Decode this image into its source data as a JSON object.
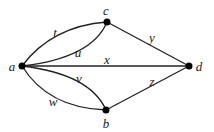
{
  "graph": {
    "nodes": [
      {
        "id": "a",
        "label": "a",
        "x": 22,
        "y": 66
      },
      {
        "id": "b",
        "label": "b",
        "x": 106,
        "y": 110
      },
      {
        "id": "c",
        "label": "c",
        "x": 107,
        "y": 22
      },
      {
        "id": "d",
        "label": "d",
        "x": 189,
        "y": 66
      }
    ],
    "edges": [
      {
        "id": "t",
        "label": "t",
        "from": "a",
        "to": "c"
      },
      {
        "id": "u",
        "label": "u",
        "from": "a",
        "to": "c"
      },
      {
        "id": "x",
        "label": "x",
        "from": "a",
        "to": "d"
      },
      {
        "id": "v",
        "label": "v",
        "from": "a",
        "to": "b"
      },
      {
        "id": "w",
        "label": "w",
        "from": "a",
        "to": "b"
      },
      {
        "id": "y",
        "label": "y",
        "from": "c",
        "to": "d"
      },
      {
        "id": "z",
        "label": "z",
        "from": "b",
        "to": "d"
      }
    ]
  },
  "colors": {
    "stroke": "#222222",
    "node": "#000000",
    "background": "#ffffff"
  }
}
